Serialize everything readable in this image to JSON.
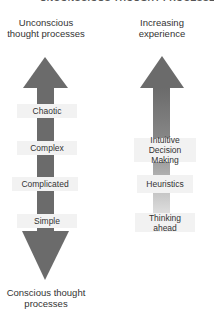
{
  "title": "UNCONSCIOUS THOUGHT PROCESSES",
  "left_column": {
    "top_heading": "Unconscious thought processes",
    "bottom_heading": "Conscious thought processes",
    "labels": [
      "Chaotic",
      "Complex",
      "Complicated",
      "Simple"
    ],
    "arrow_color": "#6b6b6b"
  },
  "right_column": {
    "top_heading": "Increasing experience",
    "labels": [
      "Intuitive Decision Making",
      "Heuristics",
      "Thinking ahead"
    ],
    "arrow_color_top": "#6b6b6b",
    "arrow_color_bottom": "#dcdcdc"
  },
  "label_box_color": "#f2f2f2"
}
